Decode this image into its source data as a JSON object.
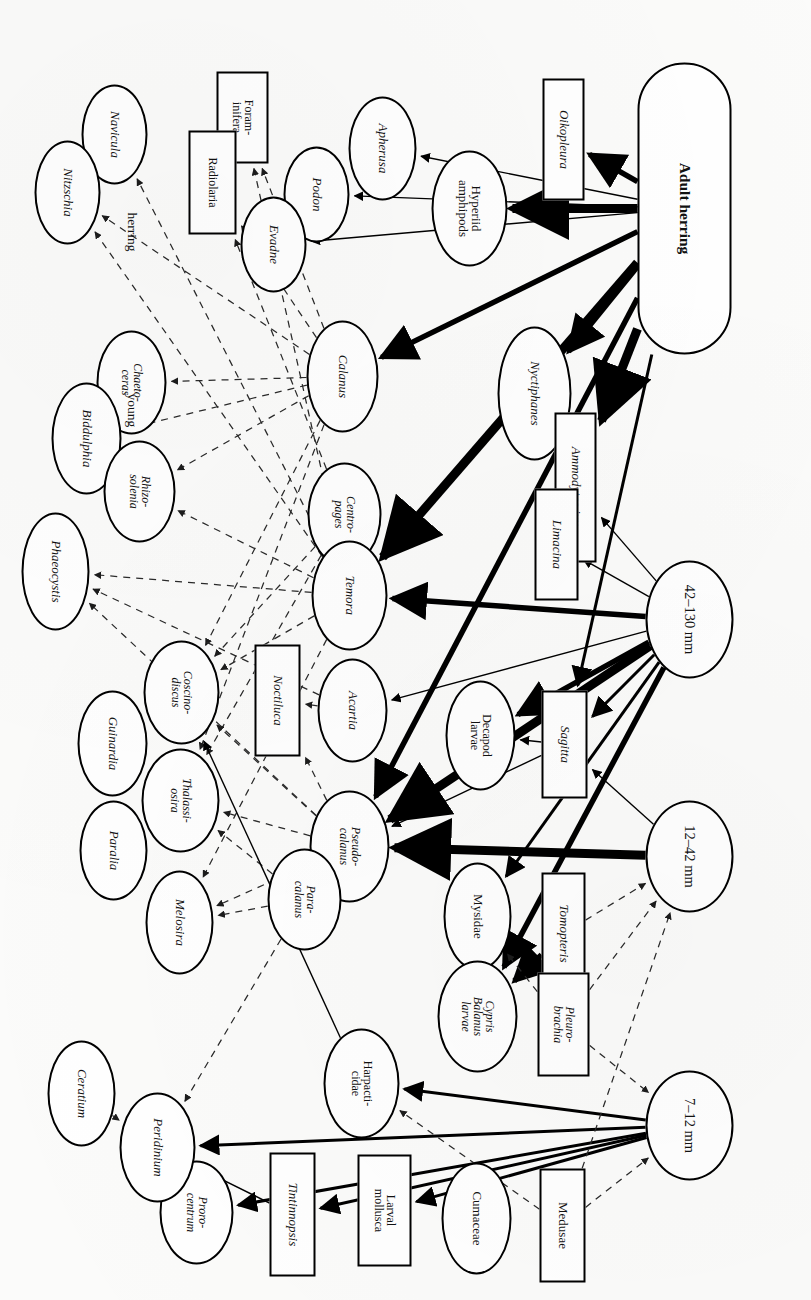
{
  "figure": {
    "type": "food-web-diagram",
    "orientation": "rotated-90-clockwise",
    "caption_fragment": ""
  },
  "group_labels": [
    {
      "id": "lbl-herring",
      "text": "herring",
      "x": 212,
      "y": 672
    },
    {
      "id": "lbl-young",
      "text": "young",
      "x": 393,
      "y": 672
    }
  ],
  "nodes": [
    {
      "id": "adult-herring",
      "label": "Adult herring",
      "shape": "stadium",
      "italic": false,
      "x": 62,
      "y": 80,
      "w": 292,
      "h": 94,
      "cls": "fish"
    },
    {
      "id": "size-42-130",
      "label": "42–130 mm",
      "shape": "ellipse",
      "italic": false,
      "x": 560,
      "y": 78,
      "w": 118,
      "h": 88,
      "cls": "sz"
    },
    {
      "id": "size-12-42",
      "label": "12–42 mm",
      "shape": "ellipse",
      "italic": false,
      "x": 800,
      "y": 78,
      "w": 112,
      "h": 88,
      "cls": "sz"
    },
    {
      "id": "size-7-12",
      "label": "7–12 mm",
      "shape": "ellipse",
      "italic": false,
      "x": 1070,
      "y": 78,
      "w": 110,
      "h": 88,
      "cls": "sz"
    },
    {
      "id": "oikopleura",
      "label": "Oikopleura",
      "shape": "rect",
      "italic": true,
      "x": 78,
      "y": 227,
      "w": 122,
      "h": 42,
      "cls": "n"
    },
    {
      "id": "hyperiid-amphipods",
      "label": "Hyperiid\namphipods",
      "shape": "ellipse",
      "italic": false,
      "x": 150,
      "y": 304,
      "w": 116,
      "h": 76,
      "cls": "n"
    },
    {
      "id": "apherusa",
      "label": "Apherusa",
      "shape": "ellipse",
      "italic": true,
      "x": 96,
      "y": 395,
      "w": 104,
      "h": 68,
      "cls": "n"
    },
    {
      "id": "podon",
      "label": "Podon",
      "shape": "ellipse",
      "italic": true,
      "x": 146,
      "y": 462,
      "w": 96,
      "h": 66,
      "cls": "n"
    },
    {
      "id": "evadne",
      "label": "Evadne",
      "shape": "ellipse",
      "italic": true,
      "x": 196,
      "y": 505,
      "w": 96,
      "h": 66,
      "cls": "n"
    },
    {
      "id": "foraminifera",
      "label": "Foram-\ninifera",
      "shape": "rect",
      "italic": false,
      "x": 71,
      "y": 543,
      "w": 92,
      "h": 52,
      "cls": "nsm"
    },
    {
      "id": "radiolaria",
      "label": "Radiolaria",
      "shape": "rect",
      "italic": false,
      "x": 130,
      "y": 575,
      "w": 104,
      "h": 48,
      "cls": "nsm"
    },
    {
      "id": "navicula",
      "label": "Navicula",
      "shape": "ellipse",
      "italic": true,
      "x": 84,
      "y": 664,
      "w": 100,
      "h": 66,
      "cls": "n"
    },
    {
      "id": "nitzschia",
      "label": "Nitzschia",
      "shape": "ellipse",
      "italic": true,
      "x": 140,
      "y": 711,
      "w": 104,
      "h": 66,
      "cls": "n"
    },
    {
      "id": "nyctiphanes",
      "label": "Nyctiphanes",
      "shape": "ellipse",
      "italic": true,
      "x": 326,
      "y": 240,
      "w": 134,
      "h": 74,
      "cls": "n"
    },
    {
      "id": "calamus",
      "label": "Calanus",
      "shape": "ellipse",
      "italic": true,
      "x": 320,
      "y": 433,
      "w": 112,
      "h": 72,
      "cls": "n"
    },
    {
      "id": "chaetoceras",
      "label": "Chaeto-\nceras",
      "shape": "ellipse",
      "italic": true,
      "x": 330,
      "y": 645,
      "w": 104,
      "h": 70,
      "cls": "nsm"
    },
    {
      "id": "biddulphia",
      "label": "Biddulphia",
      "shape": "ellipse",
      "italic": true,
      "x": 382,
      "y": 690,
      "w": 112,
      "h": 70,
      "cls": "n"
    },
    {
      "id": "ammodytes",
      "label": "Ammodytes juv.",
      "shape": "rect",
      "italic": true,
      "x": 412,
      "y": 215,
      "w": 150,
      "h": 42,
      "cls": "n"
    },
    {
      "id": "limacina",
      "label": "Limacina",
      "shape": "rect",
      "italic": true,
      "x": 488,
      "y": 233,
      "w": 112,
      "h": 44,
      "cls": "n"
    },
    {
      "id": "centropages",
      "label": "Centro-\npages",
      "shape": "ellipse",
      "italic": true,
      "x": 462,
      "y": 430,
      "w": 104,
      "h": 74,
      "cls": "nsm"
    },
    {
      "id": "rhizosolenia",
      "label": "Rhizo-\nsolenia",
      "shape": "ellipse",
      "italic": true,
      "x": 440,
      "y": 636,
      "w": 102,
      "h": 72,
      "cls": "nsm"
    },
    {
      "id": "phaeocystis",
      "label": "Phaeocystis",
      "shape": "ellipse",
      "italic": true,
      "x": 512,
      "y": 722,
      "w": 118,
      "h": 68,
      "cls": "n"
    },
    {
      "id": "temora",
      "label": "Temora",
      "shape": "ellipse",
      "italic": true,
      "x": 540,
      "y": 424,
      "w": 110,
      "h": 76,
      "cls": "n"
    },
    {
      "id": "sagitta",
      "label": "Sagitta",
      "shape": "rect",
      "italic": true,
      "x": 690,
      "y": 224,
      "w": 108,
      "h": 46,
      "cls": "n"
    },
    {
      "id": "decapod-larvae",
      "label": "Decapod\nlarvae",
      "shape": "ellipse",
      "italic": false,
      "x": 680,
      "y": 296,
      "w": 110,
      "h": 70,
      "cls": "nsm"
    },
    {
      "id": "acartia",
      "label": "Acartia",
      "shape": "ellipse",
      "italic": true,
      "x": 658,
      "y": 424,
      "w": 104,
      "h": 70,
      "cls": "n"
    },
    {
      "id": "noctiluca",
      "label": "Noctiluca",
      "shape": "rect",
      "italic": true,
      "x": 644,
      "y": 511,
      "w": 112,
      "h": 46,
      "cls": "n"
    },
    {
      "id": "coscinodiscus",
      "label": "Coscino-\ndiscus",
      "shape": "ellipse",
      "italic": true,
      "x": 640,
      "y": 592,
      "w": 104,
      "h": 76,
      "cls": "nsm"
    },
    {
      "id": "guinardia",
      "label": "Guinardia",
      "shape": "ellipse",
      "italic": true,
      "x": 690,
      "y": 664,
      "w": 106,
      "h": 70,
      "cls": "n"
    },
    {
      "id": "pseudocalamus",
      "label": "Pseudo-\ncalanus",
      "shape": "ellipse",
      "italic": true,
      "x": 790,
      "y": 422,
      "w": 112,
      "h": 80,
      "cls": "nsm"
    },
    {
      "id": "paracalamus",
      "label": "Para-\ncalanus",
      "shape": "ellipse",
      "italic": true,
      "x": 848,
      "y": 470,
      "w": 102,
      "h": 74,
      "cls": "nsm"
    },
    {
      "id": "thalassiosira",
      "label": "Thalassi-\nosira",
      "shape": "ellipse",
      "italic": true,
      "x": 748,
      "y": 592,
      "w": 104,
      "h": 78,
      "cls": "nsm"
    },
    {
      "id": "paralia",
      "label": "Paralia",
      "shape": "ellipse",
      "italic": true,
      "x": 800,
      "y": 664,
      "w": 100,
      "h": 68,
      "cls": "n"
    },
    {
      "id": "melosira",
      "label": "Melosira",
      "shape": "ellipse",
      "italic": true,
      "x": 870,
      "y": 598,
      "w": 104,
      "h": 68,
      "cls": "n"
    },
    {
      "id": "tomopteris",
      "label": "Tomopteris",
      "shape": "rect",
      "italic": true,
      "x": 872,
      "y": 226,
      "w": 122,
      "h": 44,
      "cls": "n"
    },
    {
      "id": "mysidae",
      "label": "Mysidae",
      "shape": "ellipse",
      "italic": false,
      "x": 862,
      "y": 300,
      "w": 108,
      "h": 68,
      "cls": "n"
    },
    {
      "id": "pleurobrachia",
      "label": "Pleuro-\nbrachia",
      "shape": "rect",
      "italic": true,
      "x": 972,
      "y": 222,
      "w": 104,
      "h": 52,
      "cls": "nsm"
    },
    {
      "id": "cypris-balanus",
      "label": "Cypris\nBalanus\nlarvae",
      "shape": "ellipse",
      "italic": true,
      "x": 960,
      "y": 294,
      "w": 112,
      "h": 80,
      "cls": "nsm"
    },
    {
      "id": "harpacticidae",
      "label": "Harpacti-\ncidae",
      "shape": "ellipse",
      "italic": false,
      "x": 1028,
      "y": 412,
      "w": 110,
      "h": 76,
      "cls": "nsm"
    },
    {
      "id": "medusae",
      "label": "Medusae",
      "shape": "rect",
      "italic": false,
      "x": 1168,
      "y": 226,
      "w": 114,
      "h": 46,
      "cls": "n"
    },
    {
      "id": "cumaceae",
      "label": "Cumaceae",
      "shape": "ellipse",
      "italic": false,
      "x": 1162,
      "y": 300,
      "w": 112,
      "h": 70,
      "cls": "n"
    },
    {
      "id": "larval-mollusca",
      "label": "Larval\nmollusca",
      "shape": "rect",
      "italic": false,
      "x": 1154,
      "y": 400,
      "w": 112,
      "h": 54,
      "cls": "nsm"
    },
    {
      "id": "tintinnopsis",
      "label": "Tintinnopsis",
      "shape": "rect",
      "italic": true,
      "x": 1152,
      "y": 496,
      "w": 124,
      "h": 46,
      "cls": "n"
    },
    {
      "id": "prorocentrum",
      "label": "Proro-\ncentrum",
      "shape": "ellipse",
      "italic": true,
      "x": 1160,
      "y": 578,
      "w": 104,
      "h": 74,
      "cls": "nsm"
    },
    {
      "id": "peridinium",
      "label": "Peridinium",
      "shape": "ellipse",
      "italic": true,
      "x": 1092,
      "y": 616,
      "w": 110,
      "h": 76,
      "cls": "n"
    },
    {
      "id": "ceratium",
      "label": "Ceratium",
      "shape": "ellipse",
      "italic": true,
      "x": 1040,
      "y": 696,
      "w": 106,
      "h": 68,
      "cls": "n"
    }
  ],
  "edge_styles": {
    "very_thick": {
      "label": "major predation link",
      "width": 9
    },
    "thick": {
      "label": "strong predation link",
      "width": 5.5
    },
    "medium": {
      "label": "predation link",
      "width": 3
    },
    "thin": {
      "label": "minor predation link",
      "width": 1.4
    },
    "dashed": {
      "label": "grazing / secondary link",
      "width": 1.25,
      "dash": "7 6"
    }
  },
  "edges": [
    {
      "from": "adult-herring",
      "to": "oikopleura",
      "style": "thick"
    },
    {
      "from": "adult-herring",
      "to": "hyperiid-amphipods",
      "style": "very_thick"
    },
    {
      "from": "adult-herring",
      "to": "apherusa",
      "style": "thin"
    },
    {
      "from": "adult-herring",
      "to": "evadne",
      "style": "thin"
    },
    {
      "from": "adult-herring",
      "to": "podon",
      "style": "thin"
    },
    {
      "from": "adult-herring",
      "to": "calamus",
      "style": "thick"
    },
    {
      "from": "adult-herring",
      "to": "nyctiphanes",
      "style": "thick"
    },
    {
      "from": "adult-herring",
      "to": "ammodytes",
      "style": "very_thick"
    },
    {
      "from": "adult-herring",
      "to": "temora",
      "style": "very_thick"
    },
    {
      "from": "adult-herring",
      "to": "pseudocalamus",
      "style": "thick"
    },
    {
      "from": "adult-herring",
      "to": "sagitta",
      "style": "medium"
    },
    {
      "from": "size-42-130",
      "to": "ammodytes",
      "style": "thin"
    },
    {
      "from": "size-42-130",
      "to": "limacina",
      "style": "thin"
    },
    {
      "from": "size-42-130",
      "to": "temora",
      "style": "thick"
    },
    {
      "from": "size-42-130",
      "to": "acartia",
      "style": "thin"
    },
    {
      "from": "size-42-130",
      "to": "sagitta",
      "style": "medium"
    },
    {
      "from": "size-42-130",
      "to": "decapod-larvae",
      "style": "thick"
    },
    {
      "from": "size-42-130",
      "to": "pseudocalamus",
      "style": "very_thick"
    },
    {
      "from": "size-42-130",
      "to": "mysidae",
      "style": "medium"
    },
    {
      "from": "size-42-130",
      "to": "cypris-balanus",
      "style": "thick"
    },
    {
      "from": "size-12-42",
      "to": "sagitta",
      "style": "thin"
    },
    {
      "from": "size-12-42",
      "to": "pseudocalamus",
      "style": "very_thick"
    },
    {
      "from": "size-7-12",
      "to": "harpacticidae",
      "style": "medium"
    },
    {
      "from": "size-7-12",
      "to": "larval-mollusca",
      "style": "medium"
    },
    {
      "from": "size-7-12",
      "to": "tintinnopsis",
      "style": "medium"
    },
    {
      "from": "size-7-12",
      "to": "prorocentrum",
      "style": "medium"
    },
    {
      "from": "size-7-12",
      "to": "peridinium",
      "style": "medium"
    },
    {
      "from": "medusae",
      "to": "size-7-12",
      "style": "dashed"
    },
    {
      "from": "pleurobrachia",
      "to": "size-7-12",
      "style": "dashed"
    },
    {
      "from": "pleurobrachia",
      "to": "size-12-42",
      "style": "dashed"
    },
    {
      "from": "tomopteris",
      "to": "size-12-42",
      "style": "dashed"
    },
    {
      "from": "medusae",
      "to": "size-12-42",
      "style": "dashed"
    },
    {
      "from": "calamus",
      "to": "radiolaria",
      "style": "dashed"
    },
    {
      "from": "calamus",
      "to": "foraminifera",
      "style": "dashed"
    },
    {
      "from": "calamus",
      "to": "chaetoceras",
      "style": "dashed"
    },
    {
      "from": "calamus",
      "to": "biddulphia",
      "style": "dashed"
    },
    {
      "from": "calamus",
      "to": "rhizosolenia",
      "style": "dashed"
    },
    {
      "from": "calamus",
      "to": "nitzschia",
      "style": "dashed"
    },
    {
      "from": "calamus",
      "to": "coscinodiscus",
      "style": "dashed"
    },
    {
      "from": "calamus",
      "to": "thalassiosira",
      "style": "dashed"
    },
    {
      "from": "temora",
      "to": "foraminifera",
      "style": "dashed"
    },
    {
      "from": "temora",
      "to": "navicula",
      "style": "dashed"
    },
    {
      "from": "temora",
      "to": "nitzschia",
      "style": "dashed"
    },
    {
      "from": "temora",
      "to": "rhizosolenia",
      "style": "dashed"
    },
    {
      "from": "temora",
      "to": "phaeocystis",
      "style": "dashed"
    },
    {
      "from": "temora",
      "to": "coscinodiscus",
      "style": "dashed"
    },
    {
      "from": "temora",
      "to": "melosira",
      "style": "dashed"
    },
    {
      "from": "centropages",
      "to": "radiolaria",
      "style": "dashed"
    },
    {
      "from": "centropages",
      "to": "coscinodiscus",
      "style": "dashed"
    },
    {
      "from": "centropages",
      "to": "thalassiosira",
      "style": "dashed"
    },
    {
      "from": "acartia",
      "to": "phaeocystis",
      "style": "dashed"
    },
    {
      "from": "acartia",
      "to": "noctiluca",
      "style": "dashed"
    },
    {
      "from": "pseudocalamus",
      "to": "coscinodiscus",
      "style": "dashed"
    },
    {
      "from": "pseudocalamus",
      "to": "thalassiosira",
      "style": "dashed"
    },
    {
      "from": "pseudocalamus",
      "to": "melosira",
      "style": "dashed"
    },
    {
      "from": "pseudocalamus",
      "to": "phaeocystis",
      "style": "dashed"
    },
    {
      "from": "pseudocalamus",
      "to": "noctiluca",
      "style": "dashed"
    },
    {
      "from": "paracalamus",
      "to": "thalassiosira",
      "style": "dashed"
    },
    {
      "from": "paracalamus",
      "to": "melosira",
      "style": "dashed"
    },
    {
      "from": "paracalamus",
      "to": "peridinium",
      "style": "dashed"
    },
    {
      "from": "harpacticidae",
      "to": "coscinodiscus",
      "style": "thin"
    },
    {
      "from": "tintinnopsis",
      "to": "peridinium",
      "style": "thin"
    },
    {
      "from": "ceratium",
      "to": "peridinium",
      "style": "dashed"
    },
    {
      "from": "sagitta",
      "to": "decapod-larvae",
      "style": "thin"
    },
    {
      "from": "sagitta",
      "to": "pseudocalamus",
      "style": "thin"
    },
    {
      "from": "tomopteris",
      "to": "cypris-balanus",
      "style": "thick"
    },
    {
      "from": "medusae",
      "to": "harpacticidae",
      "style": "dashed"
    },
    {
      "from": "pleurobrachia",
      "to": "mysidae",
      "style": "dashed"
    }
  ]
}
